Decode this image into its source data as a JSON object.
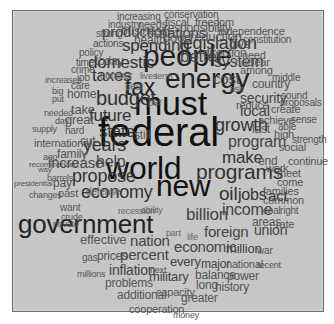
{
  "panel": {
    "background": "#c6c6c6",
    "border": "#6e6e6e"
  },
  "words": [
    {
      "text": "federal",
      "x": 98,
      "y": 145,
      "size": 40,
      "tone": 0
    },
    {
      "text": "must",
      "x": 134,
      "y": 114,
      "size": 34,
      "tone": 0
    },
    {
      "text": "world",
      "x": 106,
      "y": 178,
      "size": 32,
      "tone": 0
    },
    {
      "text": "new",
      "x": 156,
      "y": 196,
      "size": 30,
      "tone": 0
    },
    {
      "text": "people",
      "x": 143,
      "y": 66,
      "size": 30,
      "tone": 1
    },
    {
      "text": "energy",
      "x": 165,
      "y": 88,
      "size": 28,
      "tone": 1
    },
    {
      "text": "government",
      "x": 18,
      "y": 232,
      "size": 26,
      "tone": 1
    },
    {
      "text": "tax",
      "x": 125,
      "y": 95,
      "size": 23,
      "tone": 1
    },
    {
      "text": "programs",
      "x": 196,
      "y": 178,
      "size": 21,
      "tone": 2
    },
    {
      "text": "budget",
      "x": 96,
      "y": 104,
      "size": 20,
      "tone": 2
    },
    {
      "text": "oil",
      "x": 219,
      "y": 200,
      "size": 19,
      "tone": 2
    },
    {
      "text": "jobs",
      "x": 238,
      "y": 200,
      "size": 16,
      "tone": 2
    },
    {
      "text": "act",
      "x": 268,
      "y": 200,
      "size": 15,
      "tone": 2
    },
    {
      "text": "domestic",
      "x": 88,
      "y": 68,
      "size": 17,
      "tone": 2
    },
    {
      "text": "taxes",
      "x": 92,
      "y": 81,
      "size": 17,
      "tone": 2
    },
    {
      "text": "years",
      "x": 83,
      "y": 151,
      "size": 18,
      "tone": 2
    },
    {
      "text": "state",
      "x": 99,
      "y": 137,
      "size": 17,
      "tone": 2
    },
    {
      "text": "future",
      "x": 89,
      "y": 121,
      "size": 17,
      "tone": 2
    },
    {
      "text": "growth",
      "x": 215,
      "y": 131,
      "size": 18,
      "tone": 2
    },
    {
      "text": "propose",
      "x": 72,
      "y": 182,
      "size": 18,
      "tone": 2
    },
    {
      "text": "economy",
      "x": 81,
      "y": 198,
      "size": 18,
      "tone": 2
    },
    {
      "text": "help",
      "x": 96,
      "y": 167,
      "size": 16,
      "tone": 3
    },
    {
      "text": "increase",
      "x": 48,
      "y": 167,
      "size": 15,
      "tone": 3
    },
    {
      "text": "make",
      "x": 222,
      "y": 163,
      "size": 17,
      "tone": 2
    },
    {
      "text": "program",
      "x": 228,
      "y": 147,
      "size": 16,
      "tone": 3
    },
    {
      "text": "legislation",
      "x": 179,
      "y": 49,
      "size": 18,
      "tone": 2
    },
    {
      "text": "spending",
      "x": 122,
      "y": 51,
      "size": 17,
      "tone": 2
    },
    {
      "text": "production",
      "x": 102,
      "y": 36,
      "size": 15,
      "tone": 3
    },
    {
      "text": "nations",
      "x": 159,
      "y": 37,
      "size": 15,
      "tone": 3
    },
    {
      "text": "system",
      "x": 214,
      "y": 67,
      "size": 16,
      "tone": 3
    },
    {
      "text": "better",
      "x": 180,
      "y": 62,
      "size": 17,
      "tone": 3
    },
    {
      "text": "security",
      "x": 240,
      "y": 102,
      "size": 14,
      "tone": 3
    },
    {
      "text": "local",
      "x": 240,
      "y": 115,
      "size": 15,
      "tone": 3
    },
    {
      "text": "cost",
      "x": 213,
      "y": 83,
      "size": 15,
      "tone": 3
    },
    {
      "text": "billion",
      "x": 186,
      "y": 220,
      "size": 17,
      "tone": 3
    },
    {
      "text": "income",
      "x": 222,
      "y": 215,
      "size": 16,
      "tone": 3
    },
    {
      "text": "foreign",
      "x": 204,
      "y": 236,
      "size": 15,
      "tone": 3
    },
    {
      "text": "union",
      "x": 254,
      "y": 234,
      "size": 14,
      "tone": 3
    },
    {
      "text": "economic",
      "x": 174,
      "y": 251,
      "size": 15,
      "tone": 3
    },
    {
      "text": "nation",
      "x": 130,
      "y": 245,
      "size": 15,
      "tone": 3
    },
    {
      "text": "percent",
      "x": 120,
      "y": 259,
      "size": 15,
      "tone": 3
    },
    {
      "text": "inflation",
      "x": 109,
      "y": 274,
      "size": 14,
      "tone": 3
    },
    {
      "text": "million",
      "x": 226,
      "y": 253,
      "size": 13,
      "tone": 3
    },
    {
      "text": "every",
      "x": 170,
      "y": 266,
      "size": 13,
      "tone": 3
    },
    {
      "text": "major",
      "x": 201,
      "y": 268,
      "size": 12,
      "tone": 3
    },
    {
      "text": "military",
      "x": 149,
      "y": 281,
      "size": 13,
      "tone": 3
    },
    {
      "text": "effective",
      "x": 80,
      "y": 244,
      "size": 13,
      "tone": 4
    },
    {
      "text": "problems",
      "x": 105,
      "y": 287,
      "size": 12,
      "tone": 4
    },
    {
      "text": "prices",
      "x": 97,
      "y": 260,
      "size": 12,
      "tone": 4
    },
    {
      "text": "gas",
      "x": 82,
      "y": 261,
      "size": 10,
      "tone": 4
    },
    {
      "text": "millions",
      "x": 77,
      "y": 277,
      "size": 9,
      "tone": 4
    },
    {
      "text": "next",
      "x": 150,
      "y": 273,
      "size": 9,
      "tone": 4
    },
    {
      "text": "additional",
      "x": 117,
      "y": 299,
      "size": 12,
      "tone": 4
    },
    {
      "text": "capacity",
      "x": 156,
      "y": 296,
      "size": 11,
      "tone": 4
    },
    {
      "text": "greater",
      "x": 181,
      "y": 302,
      "size": 12,
      "tone": 4
    },
    {
      "text": "cooperation",
      "x": 129,
      "y": 313,
      "size": 11,
      "tone": 4
    },
    {
      "text": "money",
      "x": 173,
      "y": 318,
      "size": 9,
      "tone": 4
    },
    {
      "text": "balance",
      "x": 195,
      "y": 279,
      "size": 12,
      "tone": 4
    },
    {
      "text": "long",
      "x": 196,
      "y": 289,
      "size": 12,
      "tone": 4
    },
    {
      "text": "history",
      "x": 215,
      "y": 291,
      "size": 12,
      "tone": 4
    },
    {
      "text": "power",
      "x": 227,
      "y": 280,
      "size": 12,
      "tone": 4
    },
    {
      "text": "national",
      "x": 226,
      "y": 268,
      "size": 11,
      "tone": 4
    },
    {
      "text": "recent",
      "x": 257,
      "y": 268,
      "size": 9,
      "tone": 4
    },
    {
      "text": "war",
      "x": 257,
      "y": 254,
      "size": 10,
      "tone": 4
    },
    {
      "text": "areas",
      "x": 252,
      "y": 226,
      "size": 12,
      "tone": 4
    },
    {
      "text": "rate",
      "x": 276,
      "y": 228,
      "size": 11,
      "tone": 4
    },
    {
      "text": "coal",
      "x": 263,
      "y": 214,
      "size": 10,
      "tone": 4
    },
    {
      "text": "right",
      "x": 280,
      "y": 214,
      "size": 10,
      "tone": 4
    },
    {
      "text": "families",
      "x": 263,
      "y": 195,
      "size": 11,
      "tone": 4
    },
    {
      "text": "common",
      "x": 263,
      "y": 204,
      "size": 11,
      "tone": 4
    },
    {
      "text": "meet",
      "x": 277,
      "y": 177,
      "size": 11,
      "tone": 4
    },
    {
      "text": "come",
      "x": 277,
      "y": 186,
      "size": 11,
      "tone": 4
    },
    {
      "text": "end",
      "x": 258,
      "y": 165,
      "size": 12,
      "tone": 4
    },
    {
      "text": "work",
      "x": 266,
      "y": 172,
      "size": 11,
      "tone": 4
    },
    {
      "text": "continue",
      "x": 288,
      "y": 165,
      "size": 11,
      "tone": 4
    },
    {
      "text": "social",
      "x": 279,
      "y": 151,
      "size": 11,
      "tone": 4
    },
    {
      "text": "strength",
      "x": 292,
      "y": 143,
      "size": 10,
      "tone": 4
    },
    {
      "text": "high",
      "x": 274,
      "y": 138,
      "size": 11,
      "tone": 4
    },
    {
      "text": "last",
      "x": 252,
      "y": 133,
      "size": 12,
      "tone": 4
    },
    {
      "text": "able",
      "x": 278,
      "y": 130,
      "size": 10,
      "tone": 4
    },
    {
      "text": "achieve",
      "x": 258,
      "y": 124,
      "size": 11,
      "tone": 4
    },
    {
      "text": "sense",
      "x": 291,
      "y": 123,
      "size": 10,
      "tone": 4
    },
    {
      "text": "create",
      "x": 271,
      "y": 113,
      "size": 11,
      "tone": 4
    },
    {
      "text": "reduce",
      "x": 236,
      "y": 109,
      "size": 11,
      "tone": 4
    },
    {
      "text": "proposals",
      "x": 280,
      "y": 106,
      "size": 10,
      "tone": 4
    },
    {
      "text": "sound",
      "x": 281,
      "y": 99,
      "size": 10,
      "tone": 4
    },
    {
      "text": "ask",
      "x": 230,
      "y": 92,
      "size": 9,
      "tone": 4
    },
    {
      "text": "country",
      "x": 252,
      "y": 88,
      "size": 12,
      "tone": 4
    },
    {
      "text": "middle",
      "x": 272,
      "y": 81,
      "size": 10,
      "tone": 4
    },
    {
      "text": "among",
      "x": 240,
      "y": 74,
      "size": 11,
      "tone": 4
    },
    {
      "text": "nuclear",
      "x": 235,
      "y": 66,
      "size": 11,
      "tone": 4
    },
    {
      "text": "need",
      "x": 242,
      "y": 59,
      "size": 11,
      "tone": 4
    },
    {
      "text": "direction",
      "x": 203,
      "y": 57,
      "size": 12,
      "tone": 4
    },
    {
      "text": "give",
      "x": 229,
      "y": 48,
      "size": 12,
      "tone": 4
    },
    {
      "text": "constitution",
      "x": 243,
      "y": 43,
      "size": 10,
      "tone": 4
    },
    {
      "text": "reduction",
      "x": 190,
      "y": 41,
      "size": 13,
      "tone": 4
    },
    {
      "text": "good",
      "x": 163,
      "y": 42,
      "size": 13,
      "tone": 4
    },
    {
      "text": "independence",
      "x": 218,
      "y": 35,
      "size": 11,
      "tone": 4
    },
    {
      "text": "responsibility",
      "x": 164,
      "y": 32,
      "size": 12,
      "tone": 4
    },
    {
      "text": "freedom",
      "x": 195,
      "y": 26,
      "size": 11,
      "tone": 4
    },
    {
      "text": "fiscal",
      "x": 165,
      "y": 26,
      "size": 11,
      "tone": 4
    },
    {
      "text": "conservation",
      "x": 164,
      "y": 18,
      "size": 10,
      "tone": 4
    },
    {
      "text": "increasing",
      "x": 117,
      "y": 20,
      "size": 10,
      "tone": 4
    },
    {
      "text": "industry",
      "x": 108,
      "y": 28,
      "size": 10,
      "tone": 4
    },
    {
      "text": "needs",
      "x": 138,
      "y": 28,
      "size": 11,
      "tone": 4
    },
    {
      "text": "strong",
      "x": 96,
      "y": 37,
      "size": 10,
      "tone": 4
    },
    {
      "text": "business",
      "x": 121,
      "y": 35,
      "size": 12,
      "tone": 4
    },
    {
      "text": "health",
      "x": 134,
      "y": 44,
      "size": 12,
      "tone": 4
    },
    {
      "text": "actions",
      "x": 93,
      "y": 47,
      "size": 10,
      "tone": 4
    },
    {
      "text": "policy",
      "x": 79,
      "y": 56,
      "size": 10,
      "tone": 4
    },
    {
      "text": "time",
      "x": 76,
      "y": 66,
      "size": 10,
      "tone": 4
    },
    {
      "text": "today",
      "x": 95,
      "y": 65,
      "size": 12,
      "tone": 4
    },
    {
      "text": "crime",
      "x": 71,
      "y": 73,
      "size": 10,
      "tone": 4
    },
    {
      "text": "number",
      "x": 100,
      "y": 79,
      "size": 10,
      "tone": 5
    },
    {
      "text": "lives",
      "x": 140,
      "y": 79,
      "size": 9,
      "tone": 5
    },
    {
      "text": "term",
      "x": 155,
      "y": 79,
      "size": 9,
      "tone": 5
    },
    {
      "text": "increases",
      "x": 45,
      "y": 83,
      "size": 9,
      "tone": 4
    },
    {
      "text": "job",
      "x": 77,
      "y": 81,
      "size": 10,
      "tone": 4
    },
    {
      "text": "care",
      "x": 71,
      "y": 89,
      "size": 10,
      "tone": 4
    },
    {
      "text": "best",
      "x": 125,
      "y": 90,
      "size": 10,
      "tone": 5
    },
    {
      "text": "big",
      "x": 52,
      "y": 94,
      "size": 9,
      "tone": 4
    },
    {
      "text": "put",
      "x": 52,
      "y": 102,
      "size": 9,
      "tone": 4
    },
    {
      "text": "home",
      "x": 67,
      "y": 98,
      "size": 12,
      "tone": 4
    },
    {
      "text": "per",
      "x": 148,
      "y": 106,
      "size": 10,
      "tone": 5
    },
    {
      "text": "needed",
      "x": 44,
      "y": 116,
      "size": 9,
      "tone": 4
    },
    {
      "text": "take",
      "x": 71,
      "y": 114,
      "size": 13,
      "tone": 4
    },
    {
      "text": "day",
      "x": 55,
      "y": 124,
      "size": 9,
      "tone": 4
    },
    {
      "text": "great",
      "x": 65,
      "y": 124,
      "size": 13,
      "tone": 4
    },
    {
      "text": "supply",
      "x": 32,
      "y": 132,
      "size": 9,
      "tone": 4
    },
    {
      "text": "hard",
      "x": 65,
      "y": 134,
      "size": 10,
      "tone": 4
    },
    {
      "text": "still",
      "x": 134,
      "y": 139,
      "size": 12,
      "tone": 4
    },
    {
      "text": "international",
      "x": 34,
      "y": 147,
      "size": 11,
      "tone": 4
    },
    {
      "text": "cut",
      "x": 80,
      "y": 145,
      "size": 12,
      "tone": 4
    },
    {
      "text": "ago",
      "x": 43,
      "y": 160,
      "size": 9,
      "tone": 4
    },
    {
      "text": "family",
      "x": 57,
      "y": 158,
      "size": 12,
      "tone": 4
    },
    {
      "text": "recommended",
      "x": 29,
      "y": 168,
      "size": 8,
      "tone": 4
    },
    {
      "text": "way",
      "x": 38,
      "y": 173,
      "size": 8,
      "tone": 4
    },
    {
      "text": "barrels",
      "x": 47,
      "y": 181,
      "size": 9,
      "tone": 4
    },
    {
      "text": "presidential",
      "x": 14,
      "y": 187,
      "size": 8,
      "tone": 4
    },
    {
      "text": "pay",
      "x": 53,
      "y": 187,
      "size": 12,
      "tone": 4
    },
    {
      "text": "changes",
      "x": 29,
      "y": 198,
      "size": 9,
      "tone": 4
    },
    {
      "text": "past",
      "x": 58,
      "y": 197,
      "size": 11,
      "tone": 4
    },
    {
      "text": "defense",
      "x": 86,
      "y": 195,
      "size": 10,
      "tone": 5
    },
    {
      "text": "want",
      "x": 60,
      "y": 211,
      "size": 10,
      "tone": 4
    },
    {
      "text": "ability",
      "x": 141,
      "y": 213,
      "size": 9,
      "tone": 5
    },
    {
      "text": "recession",
      "x": 118,
      "y": 214,
      "size": 9,
      "tone": 5
    },
    {
      "text": "crude",
      "x": 61,
      "y": 220,
      "size": 9,
      "tone": 4
    },
    {
      "text": "private",
      "x": 53,
      "y": 227,
      "size": 9,
      "tone": 4
    },
    {
      "text": "part",
      "x": 166,
      "y": 236,
      "size": 9,
      "tone": 5
    },
    {
      "text": "life",
      "x": 187,
      "y": 240,
      "size": 9,
      "tone": 5
    }
  ]
}
